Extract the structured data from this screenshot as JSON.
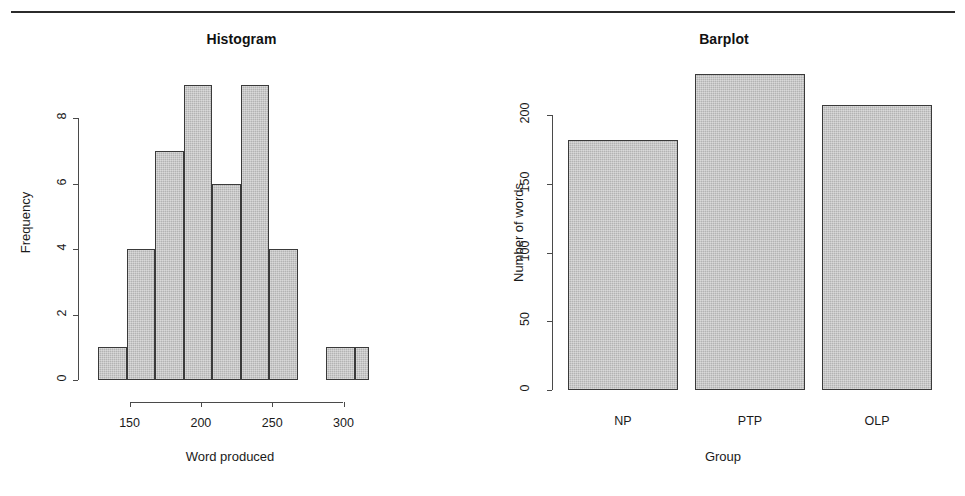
{
  "page": {
    "background": "#ffffff",
    "rule_color": "#2b2b2b",
    "bar_fill": "#b3b3b3",
    "bar_border": "#3a3a3a",
    "axis_color": "#4a4a4a"
  },
  "chart_data": [
    {
      "type": "bar",
      "id": "histogram",
      "title": "Histogram",
      "xlabel": "Word produced",
      "ylabel": "Frequency",
      "grid": false,
      "legend": "none",
      "xlim": [
        125,
        320
      ],
      "ylim": [
        0,
        9
      ],
      "bin_width": 20,
      "bin_edges": [
        128,
        148,
        168,
        188,
        208,
        228,
        248,
        268,
        288,
        308,
        318
      ],
      "categories": [
        "128-148",
        "148-168",
        "168-188",
        "188-208",
        "208-228",
        "228-248",
        "248-268",
        "268-288",
        "288-308",
        "308-318"
      ],
      "values": [
        1,
        4,
        7,
        9,
        6,
        9,
        4,
        0,
        1,
        1
      ],
      "x_ticks": [
        150,
        200,
        250,
        300
      ],
      "x_tick_labels": [
        "150",
        "200",
        "250",
        "300"
      ],
      "y_ticks": [
        0,
        2,
        4,
        6,
        8
      ],
      "y_tick_labels": [
        "0",
        "2",
        "4",
        "6",
        "8"
      ]
    },
    {
      "type": "bar",
      "id": "barplot",
      "title": "Barplot",
      "xlabel": "Group",
      "ylabel": "Number of words",
      "grid": false,
      "legend": "none",
      "ylim": [
        0,
        230
      ],
      "categories": [
        "NP",
        "PTP",
        "OLP"
      ],
      "values": [
        182,
        230,
        207
      ],
      "y_ticks": [
        0,
        50,
        100,
        150,
        200
      ],
      "y_tick_labels": [
        "0",
        "50",
        "100",
        "150",
        "200"
      ],
      "x_tick_labels": [
        "NP",
        "PTP",
        "OLP"
      ]
    }
  ]
}
